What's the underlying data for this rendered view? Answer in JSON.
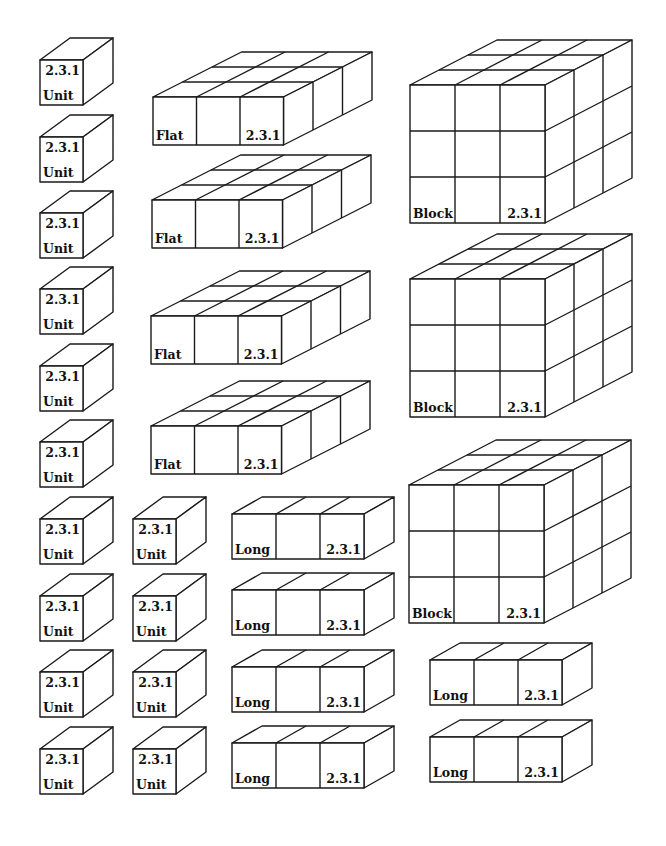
{
  "colors": {
    "stroke": "#1a1a1a",
    "fill": "#ffffff",
    "text": "#111111"
  },
  "code": "2.3.1",
  "types": {
    "unit": {
      "label": "Unit",
      "cols": 1,
      "rows": 1,
      "depth": 1,
      "cw": 43,
      "ch": 45,
      "ddx": 30,
      "ddy": -22
    },
    "flat": {
      "label": "Flat",
      "cols": 3,
      "rows": 1,
      "depth": 3,
      "cw": 43.5,
      "ch": 48,
      "ddx": 29.5,
      "ddy": -15
    },
    "block": {
      "label": "Block",
      "cols": 3,
      "rows": 3,
      "depth": 3,
      "cw": 45,
      "ch": 46,
      "ddx": 29,
      "ddy": -15
    },
    "long": {
      "label": "Long",
      "cols": 3,
      "rows": 1,
      "depth": 1,
      "cw": 44,
      "ch": 45,
      "ddx": 30,
      "ddy": -17
    }
  },
  "pieces": [
    {
      "type": "unit",
      "x": 40,
      "y": 60
    },
    {
      "type": "unit",
      "x": 40,
      "y": 137
    },
    {
      "type": "unit",
      "x": 40,
      "y": 213
    },
    {
      "type": "unit",
      "x": 40,
      "y": 289
    },
    {
      "type": "unit",
      "x": 40,
      "y": 366
    },
    {
      "type": "unit",
      "x": 40,
      "y": 442
    },
    {
      "type": "unit",
      "x": 40,
      "y": 519
    },
    {
      "type": "unit",
      "x": 40,
      "y": 596
    },
    {
      "type": "unit",
      "x": 40,
      "y": 672
    },
    {
      "type": "unit",
      "x": 40,
      "y": 749
    },
    {
      "type": "unit",
      "x": 133,
      "y": 519
    },
    {
      "type": "unit",
      "x": 133,
      "y": 596
    },
    {
      "type": "unit",
      "x": 133,
      "y": 672
    },
    {
      "type": "unit",
      "x": 133,
      "y": 749
    },
    {
      "type": "flat",
      "x": 153,
      "y": 97
    },
    {
      "type": "flat",
      "x": 152,
      "y": 200
    },
    {
      "type": "flat",
      "x": 151,
      "y": 316
    },
    {
      "type": "flat",
      "x": 151,
      "y": 426
    },
    {
      "type": "block",
      "x": 410,
      "y": 85
    },
    {
      "type": "block",
      "x": 410,
      "y": 279
    },
    {
      "type": "block",
      "x": 409,
      "y": 485
    },
    {
      "type": "long",
      "x": 232,
      "y": 514
    },
    {
      "type": "long",
      "x": 232,
      "y": 590
    },
    {
      "type": "long",
      "x": 232,
      "y": 667
    },
    {
      "type": "long",
      "x": 232,
      "y": 743
    },
    {
      "type": "long",
      "x": 430,
      "y": 660
    },
    {
      "type": "long",
      "x": 430,
      "y": 737
    }
  ]
}
